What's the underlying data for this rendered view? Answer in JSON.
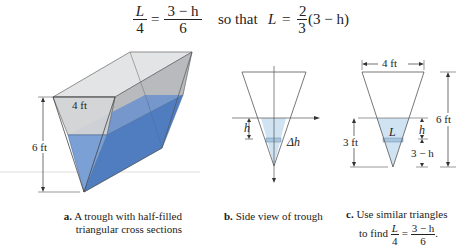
{
  "equation": {
    "lhs_num": "L",
    "lhs_den": "4",
    "eq1": "=",
    "rhs_num": "3 − h",
    "rhs_den": "6",
    "connector": "so that",
    "result_var": "L",
    "eq2": "=",
    "coef_num": "2",
    "coef_den": "3",
    "result_tail": "(3 − h)"
  },
  "panel_a": {
    "width_label": "4 ft",
    "height_label": "6 ft",
    "caption_letter": "a.",
    "caption_line1": "A trough with half-filled",
    "caption_line2": "triangular cross sections"
  },
  "panel_b": {
    "h_label": "h",
    "dh_label": "Δh",
    "caption_letter": "b.",
    "caption_text": "Side view of trough"
  },
  "panel_c": {
    "top_label": "4 ft",
    "total_height_label": "6 ft",
    "water_depth_label": "3 ft",
    "L_label": "L",
    "h_label": "h",
    "remainder_label": "3 − h",
    "caption_letter": "c.",
    "caption_line1": "Use similar triangles",
    "caption_line2": "to find",
    "caption_frac_lhs_num": "L",
    "caption_frac_lhs_den": "4",
    "caption_eq": "=",
    "caption_frac_rhs_num": "3 − h",
    "caption_frac_rhs_den": "6",
    "caption_period": "."
  },
  "colors": {
    "water_dark": "#5b86c4",
    "water_light": "#c9e0f1",
    "glass": "#cfd1d3",
    "line": "#444444"
  }
}
